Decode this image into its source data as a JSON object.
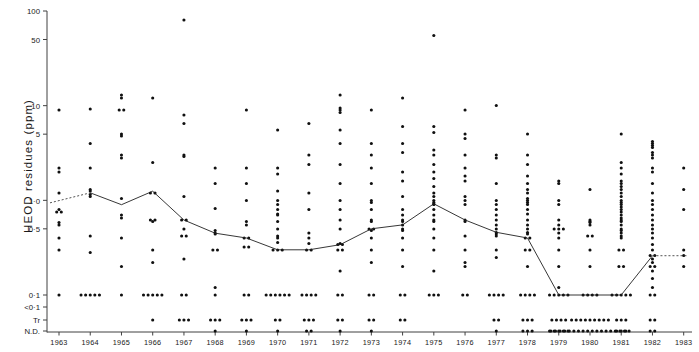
{
  "figure": {
    "ylabel": "HEOD  residues  (ppm)",
    "xlabel": "",
    "title": ""
  },
  "axes": {
    "y_ticks": [
      {
        "label": "100",
        "value": 100
      },
      {
        "label": "50",
        "value": 50
      },
      {
        "label": "10",
        "value": 10
      },
      {
        "label": "5",
        "value": 5
      },
      {
        "label": "1·0",
        "value": 1.0
      },
      {
        "label": "0·5",
        "value": 0.5
      },
      {
        "label": "0·1",
        "value": 0.1
      },
      {
        "label": "<0·1",
        "value": 0.07
      },
      {
        "label": "Tr",
        "value": 0.05
      },
      {
        "label": "N.D.",
        "value": 0.035
      }
    ],
    "x_ticks": [
      "1963",
      "1964",
      "1965",
      "1966",
      "1967",
      "1968",
      "1969",
      "1970",
      "1971",
      "1972",
      "1973",
      "1974",
      "1975",
      "1976",
      "1977",
      "1978",
      "1979",
      "1980",
      "1981",
      "1982",
      "1983"
    ]
  },
  "colors": {
    "axis": "#404040",
    "point": "#101010",
    "median_line": "#202020",
    "dashed_line": "#404040"
  },
  "chart_data": {
    "type": "scatter",
    "title": "",
    "xlabel": "",
    "ylabel": "HEOD residues (ppm)",
    "yscale": "log-with-categorical-floor",
    "ylim": [
      0.03,
      100
    ],
    "grid": false,
    "legend": null,
    "median_series": {
      "name": "median",
      "x": [
        "1963",
        "1964",
        "1965",
        "1966",
        "1967",
        "1968",
        "1969",
        "1970",
        "1971",
        "1972",
        "1973",
        "1974",
        "1975",
        "1976",
        "1977",
        "1978",
        "1979",
        "1980",
        "1981",
        "1982",
        "1983"
      ],
      "values": [
        1.0,
        1.2,
        0.9,
        1.25,
        0.62,
        0.45,
        0.4,
        0.3,
        0.3,
        0.34,
        0.5,
        0.55,
        0.92,
        0.62,
        0.46,
        0.4,
        0.1,
        0.1,
        0.1,
        0.26,
        0.26
      ],
      "dashed_segments": [
        "1963",
        "1982-1983"
      ]
    },
    "scatter_columns": [
      {
        "year": "1963",
        "values": [
          9.0,
          2.0,
          2.2,
          1.2,
          0.75,
          0.75,
          0.8,
          0.55,
          0.58,
          0.4,
          0.3,
          0.1
        ]
      },
      {
        "year": "1964",
        "values": [
          9.2,
          4.0,
          2.2,
          1.3,
          1.25,
          1.15,
          1.1,
          0.42,
          0.28,
          0.1,
          0.1,
          0.1,
          0.1,
          0.1
        ]
      },
      {
        "year": "1965",
        "values": [
          13.0,
          12.0,
          9.0,
          9.0,
          5.0,
          4.8,
          3.0,
          2.8,
          1.05,
          0.7,
          0.65,
          0.4,
          0.2,
          0.1
        ]
      },
      {
        "year": "1966",
        "values": [
          12.0,
          2.5,
          1.2,
          1.2,
          0.62,
          0.62,
          0.6,
          0.3,
          0.22,
          0.1,
          0.1,
          0.1,
          0.1,
          0.1,
          0.05
        ]
      },
      {
        "year": "1967",
        "values": [
          80.0,
          8.0,
          6.5,
          3.0,
          2.9,
          1.1,
          0.62,
          0.62,
          0.5,
          0.42,
          0.42,
          0.24,
          0.1,
          0.1,
          0.05,
          0.05,
          0.05
        ]
      },
      {
        "year": "1968",
        "values": [
          2.2,
          1.5,
          0.82,
          0.48,
          0.45,
          0.44,
          0.3,
          0.3,
          0.12,
          0.1,
          0.05,
          0.05,
          0.05,
          0.035
        ]
      },
      {
        "year": "1969",
        "values": [
          9.0,
          2.2,
          1.5,
          1.0,
          0.6,
          0.55,
          0.4,
          0.4,
          0.32,
          0.32,
          0.1,
          0.1,
          0.05,
          0.05,
          0.05,
          0.035
        ]
      },
      {
        "year": "1970",
        "values": [
          5.5,
          2.2,
          1.9,
          1.25,
          1.0,
          0.9,
          0.8,
          0.72,
          0.7,
          0.6,
          0.5,
          0.42,
          0.4,
          0.36,
          0.3,
          0.3,
          0.3,
          0.1,
          0.1,
          0.1,
          0.1,
          0.1,
          0.1,
          0.05,
          0.05,
          0.035
        ]
      },
      {
        "year": "1971",
        "values": [
          6.5,
          3.0,
          2.4,
          1.2,
          0.8,
          0.45,
          0.4,
          0.35,
          0.3,
          0.3,
          0.1,
          0.1,
          0.1,
          0.1,
          0.05,
          0.05,
          0.05,
          0.035,
          0.035
        ]
      },
      {
        "year": "1972",
        "values": [
          13.0,
          9.5,
          9.0,
          8.5,
          5.5,
          4.0,
          2.4,
          1.5,
          1.0,
          0.8,
          0.62,
          0.5,
          0.35,
          0.34,
          0.34,
          0.3,
          0.3,
          0.18,
          0.1,
          0.1,
          0.05,
          0.05,
          0.035
        ]
      },
      {
        "year": "1973",
        "values": [
          9.0,
          4.0,
          3.0,
          2.2,
          1.5,
          1.0,
          0.95,
          0.8,
          0.62,
          0.6,
          0.5,
          0.5,
          0.48,
          0.4,
          0.3,
          0.22,
          0.1,
          0.1,
          0.05,
          0.05,
          0.035
        ]
      },
      {
        "year": "1974",
        "values": [
          12.0,
          6.0,
          4.0,
          3.2,
          2.0,
          1.6,
          1.1,
          0.8,
          0.7,
          0.62,
          0.6,
          0.55,
          0.5,
          0.48,
          0.4,
          0.3,
          0.2,
          0.1,
          0.1,
          0.05,
          0.05
        ]
      },
      {
        "year": "1975",
        "values": [
          55.0,
          6.0,
          5.2,
          3.4,
          3.0,
          2.4,
          2.0,
          1.7,
          1.4,
          1.2,
          1.1,
          1.0,
          0.95,
          0.92,
          0.9,
          0.8,
          0.7,
          0.62,
          0.6,
          0.5,
          0.4,
          0.3,
          0.18,
          0.1,
          0.1,
          0.1
        ]
      },
      {
        "year": "1976",
        "values": [
          9.0,
          5.0,
          4.5,
          3.0,
          2.2,
          1.8,
          1.6,
          1.1,
          1.0,
          0.9,
          0.62,
          0.6,
          0.42,
          0.3,
          0.22,
          0.2,
          0.1,
          0.1
        ]
      },
      {
        "year": "1977",
        "values": [
          10.0,
          3.0,
          2.8,
          1.5,
          1.0,
          0.9,
          0.8,
          0.7,
          0.62,
          0.55,
          0.5,
          0.46,
          0.44,
          0.42,
          0.3,
          0.25,
          0.1,
          0.1,
          0.1,
          0.1,
          0.05,
          0.05,
          0.035
        ]
      },
      {
        "year": "1978",
        "values": [
          5.0,
          3.0,
          2.4,
          1.8,
          1.5,
          1.3,
          1.2,
          1.05,
          1.0,
          0.95,
          0.9,
          0.8,
          0.72,
          0.62,
          0.55,
          0.5,
          0.46,
          0.44,
          0.4,
          0.4,
          0.3,
          0.3,
          0.2,
          0.1,
          0.1,
          0.1,
          0.1,
          0.05,
          0.05,
          0.05,
          0.035,
          0.035,
          0.035
        ]
      },
      {
        "year": "1979",
        "values": [
          1.6,
          1.5,
          1.0,
          0.9,
          0.62,
          0.55,
          0.5,
          0.5,
          0.5,
          0.45,
          0.4,
          0.3,
          0.2,
          0.12,
          0.1,
          0.1,
          0.1,
          0.1,
          0.1,
          0.05,
          0.05,
          0.05,
          0.05,
          0.035,
          0.035,
          0.035,
          0.035,
          0.035
        ]
      },
      {
        "year": "1980",
        "values": [
          1.3,
          0.62,
          0.6,
          0.58,
          0.55,
          0.42,
          0.42,
          0.3,
          0.2,
          0.1,
          0.1,
          0.1,
          0.1,
          0.05,
          0.05,
          0.05,
          0.05,
          0.05,
          0.05,
          0.05,
          0.05,
          0.05,
          0.035,
          0.035,
          0.035,
          0.035,
          0.035,
          0.035,
          0.035,
          0.035,
          0.035,
          0.035,
          0.035,
          0.035,
          0.035,
          0.035,
          0.035,
          0.035,
          0.035,
          0.035
        ]
      },
      {
        "year": "1981",
        "values": [
          5.0,
          2.5,
          2.2,
          1.9,
          1.6,
          1.5,
          1.4,
          1.3,
          1.2,
          1.1,
          1.0,
          0.95,
          0.9,
          0.85,
          0.8,
          0.75,
          0.7,
          0.65,
          0.62,
          0.6,
          0.55,
          0.5,
          0.48,
          0.45,
          0.42,
          0.4,
          0.3,
          0.3,
          0.2,
          0.2,
          0.1,
          0.1,
          0.1,
          0.1,
          0.1,
          0.05,
          0.05,
          0.05,
          0.035,
          0.035,
          0.035
        ]
      },
      {
        "year": "1982",
        "values": [
          4.2,
          4.0,
          3.8,
          3.6,
          3.2,
          3.0,
          2.8,
          2.2,
          2.0,
          1.5,
          1.2,
          1.0,
          0.9,
          0.8,
          0.7,
          0.62,
          0.55,
          0.5,
          0.45,
          0.4,
          0.34,
          0.3,
          0.26,
          0.26,
          0.24,
          0.22,
          0.2,
          0.2,
          0.18,
          0.15,
          0.12,
          0.1,
          0.1,
          0.05,
          0.05,
          0.035,
          0.035
        ]
      },
      {
        "year": "1983",
        "values": [
          2.2,
          1.3,
          0.8,
          0.3,
          0.26,
          0.2
        ]
      }
    ]
  }
}
